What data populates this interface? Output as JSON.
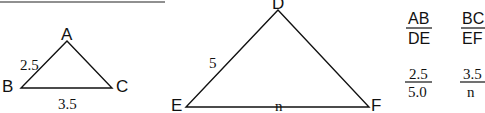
{
  "triangle_small": {
    "vertices": {
      "A": "A",
      "B": "B",
      "C": "C"
    },
    "side_AB": "2.5",
    "side_BC": "3.5"
  },
  "triangle_large": {
    "vertices": {
      "D": "D",
      "E": "E",
      "F": "F"
    },
    "side_DE": "5",
    "side_EF": "n"
  },
  "ratios": [
    {
      "numerator": "AB",
      "denominator": "DE",
      "num_value": "2.5",
      "den_value": "5.0"
    },
    {
      "numerator": "BC",
      "denominator": "EF",
      "num_value": "3.5",
      "den_value": "n"
    }
  ]
}
